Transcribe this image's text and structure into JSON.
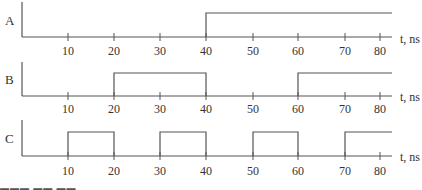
{
  "diagram": {
    "type": "timing-diagram",
    "x_axis": {
      "unit_label": "t, ns",
      "ticks": [
        10,
        20,
        30,
        40,
        50,
        60,
        70,
        80
      ],
      "tick_labels": [
        "10",
        "20",
        "30",
        "40",
        "50",
        "60",
        "70",
        "80"
      ],
      "range": [
        0,
        83
      ]
    },
    "signals": [
      {
        "name": "A",
        "transitions": [
          {
            "t": 40,
            "level": 1
          }
        ],
        "initial_level": 0,
        "description": "Low until 40 ns, then high"
      },
      {
        "name": "B",
        "transitions": [
          {
            "t": 20,
            "level": 1
          },
          {
            "t": 40,
            "level": 0
          },
          {
            "t": 60,
            "level": 1
          }
        ],
        "initial_level": 0,
        "description": "Period 40 ns, high 20-40, 60-80+"
      },
      {
        "name": "C",
        "transitions": [
          {
            "t": 10,
            "level": 1
          },
          {
            "t": 20,
            "level": 0
          },
          {
            "t": 30,
            "level": 1
          },
          {
            "t": 40,
            "level": 0
          },
          {
            "t": 50,
            "level": 1
          },
          {
            "t": 60,
            "level": 0
          },
          {
            "t": 70,
            "level": 1
          }
        ],
        "initial_level": 0,
        "description": "Period 20 ns, high 10-20, 30-40, 50-60, 70-80+"
      }
    ]
  },
  "panels": {
    "a": {
      "label": "A",
      "unit": "t, ns",
      "ticks": [
        "10",
        "20",
        "30",
        "40",
        "50",
        "60",
        "70",
        "80"
      ]
    },
    "b": {
      "label": "B",
      "unit": "t, ns",
      "ticks": [
        "10",
        "20",
        "30",
        "40",
        "50",
        "60",
        "70",
        "80"
      ]
    },
    "c": {
      "label": "C",
      "unit": "t, ns",
      "ticks": [
        "10",
        "20",
        "30",
        "40",
        "50",
        "60",
        "70",
        "80"
      ]
    }
  },
  "footer": {
    "cut_text": "▬▬▬ ▬▬ ▬▬"
  }
}
